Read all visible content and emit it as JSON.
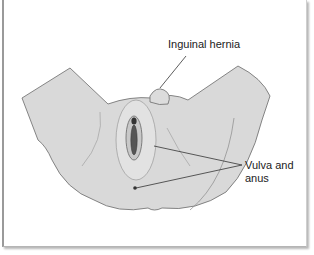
{
  "figure": {
    "type": "anatomical-illustration",
    "view": "perineal view of genitalia",
    "labels": [
      {
        "id": "inguinal-hernia",
        "text": "Inguinal hernia"
      },
      {
        "id": "vulva-and-anus",
        "line1": "Vulva and",
        "line2": "anus"
      }
    ],
    "colors": {
      "skin_fill": "#d9d9d9",
      "outline": "#555555",
      "leader_line": "#333333",
      "frame_border": "#9a9a9a",
      "background": "#ffffff"
    }
  }
}
